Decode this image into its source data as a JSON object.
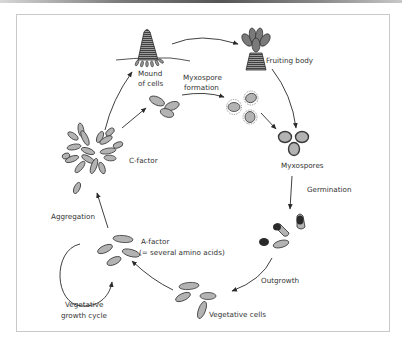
{
  "labels": {
    "mound_1": "Mound",
    "mound_2": "of cells",
    "fruiting_body": "Fruiting body",
    "myxospore_formation_1": "Myxospore",
    "myxospore_formation_2": "formation",
    "myxospores": "Myxospores",
    "germination": "Germination",
    "outgrowth": "Outgrowth",
    "vegetative_cells": "Vegetative cells",
    "a_factor_1": "A-factor",
    "a_factor_2": "(= several amino acids)",
    "vegetative_cycle_1": "Vegetative",
    "vegetative_cycle_2": "growth cycle",
    "aggregation": "Aggregation",
    "c_factor": "C-factor"
  },
  "colors": {
    "cell_fill": "#b3b3b3",
    "cell_stroke": "#3a3a3a",
    "dark": "#2a2a2a",
    "text": "#333333",
    "frame": "#c9c9c9"
  }
}
